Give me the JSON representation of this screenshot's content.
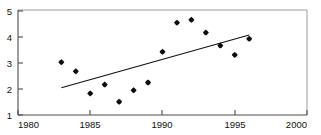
{
  "chart_data": {
    "type": "scatter",
    "title": "Changes in Average Yearly Spawning Escapement, 1983-1996",
    "xlabel": "",
    "ylabel": "",
    "x": [
      1983,
      1984,
      1985,
      1986,
      1987,
      1988,
      1989,
      1990,
      1991,
      1992,
      1993,
      1994,
      1995,
      1996
    ],
    "values": [
      3.03,
      2.68,
      1.83,
      2.17,
      1.51,
      1.95,
      2.25,
      3.43,
      4.55,
      4.66,
      4.17,
      3.67,
      3.31,
      3.93
    ],
    "series": [
      {
        "name": "Observations",
        "type": "scatter",
        "x": [
          1983,
          1984,
          1985,
          1986,
          1987,
          1988,
          1989,
          1990,
          1991,
          1992,
          1993,
          1994,
          1995,
          1996
        ],
        "values": [
          3.03,
          2.68,
          1.83,
          2.17,
          1.51,
          1.95,
          2.25,
          3.43,
          4.55,
          4.66,
          4.17,
          3.67,
          3.31,
          3.93
        ],
        "marker": "diamond",
        "color": "#0d0d0d"
      },
      {
        "name": "Trend line",
        "type": "line",
        "x": [
          1983,
          1996
        ],
        "values": [
          2.05,
          4.08
        ],
        "color": "#111111"
      }
    ],
    "xlim": [
      1980,
      2000
    ],
    "ylim": [
      1,
      5
    ],
    "xticks": [
      1980,
      1985,
      1990,
      1995,
      2000
    ],
    "xticklabels": [
      "1980",
      "1985",
      "1990",
      "1995",
      "2000"
    ],
    "yticks": [
      1,
      2,
      3,
      4,
      5
    ],
    "yticklabels": [
      "1",
      "2",
      "3",
      "4",
      "5"
    ],
    "grid": false,
    "legend": false,
    "legend_position": "none"
  }
}
